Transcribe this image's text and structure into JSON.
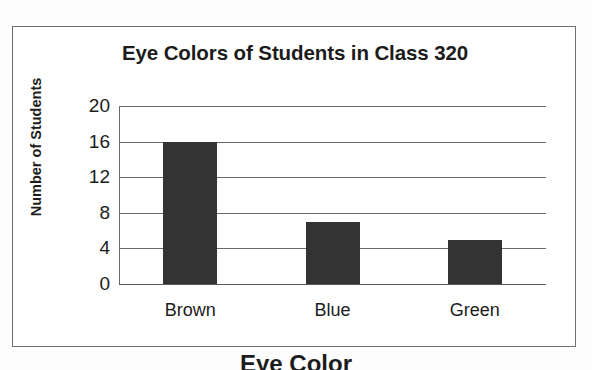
{
  "document": {
    "background_color": "#fdfdfd",
    "frame_color": "#6f6f6f"
  },
  "chart_data": {
    "type": "bar",
    "title": "Eye Colors of Students in Class 320",
    "xlabel": "Eye Color",
    "ylabel": "Number of Students",
    "categories": [
      "Brown",
      "Blue",
      "Green"
    ],
    "values": [
      16,
      7,
      5
    ],
    "ylim": [
      0,
      20
    ],
    "yticks": [
      0,
      4,
      8,
      12,
      16,
      20
    ],
    "ytick_labels": [
      "0",
      "4",
      "8",
      "12",
      "16",
      "20"
    ],
    "grid": true,
    "grid_orientation": "horizontal",
    "legend": false,
    "bar_color": "#333333",
    "gridline_color": "#6a6a6a",
    "series": [
      {
        "name": "Number of Students",
        "values": [
          16,
          7,
          5
        ]
      }
    ]
  },
  "clipped_caption": {
    "text": "Eye Color"
  }
}
